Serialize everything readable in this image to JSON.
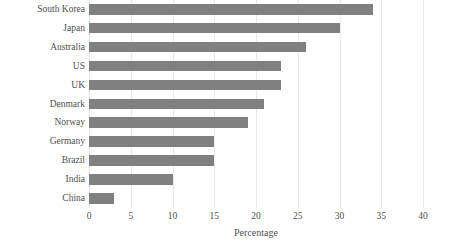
{
  "chart_data": {
    "type": "bar",
    "orientation": "horizontal",
    "title": "",
    "xlabel": "Percentage",
    "ylabel": "",
    "xlim": [
      0,
      40
    ],
    "xticks": [
      0,
      5,
      10,
      15,
      20,
      25,
      30,
      35,
      40
    ],
    "grid": true,
    "legend": false,
    "categories": [
      "South Korea",
      "Japan",
      "Australia",
      "US",
      "UK",
      "Denmark",
      "Norway",
      "Germany",
      "Brazil",
      "India",
      "China"
    ],
    "values": [
      34,
      30,
      26,
      23,
      23,
      21,
      19,
      15,
      15,
      10,
      3
    ],
    "colors": {
      "bar": "#808080",
      "gridline": "#e9e9e9",
      "text": "#4f4f4f",
      "background": "#ffffff"
    }
  }
}
